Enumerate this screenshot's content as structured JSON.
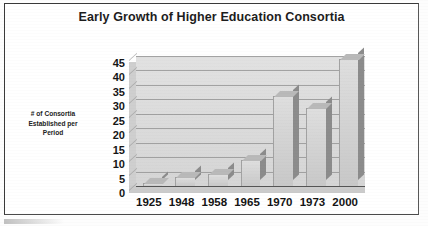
{
  "chart_data": {
    "type": "bar",
    "title": "Early Growth of Higher Education Consortia",
    "xlabel": "",
    "ylabel": "# of Consortia Established per Period",
    "ylabel_lines": [
      "# of Consortia",
      "Established per",
      "Period"
    ],
    "categories": [
      "1925",
      "1948",
      "1958",
      "1965",
      "1970",
      "1973",
      "2000"
    ],
    "values": [
      1,
      3,
      4,
      9,
      31,
      27,
      44
    ],
    "ylim": [
      0,
      45
    ],
    "ytick_step": 5,
    "yticks": [
      "45",
      "40",
      "35",
      "30",
      "25",
      "20",
      "15",
      "10",
      "5",
      "0"
    ],
    "grid": true,
    "legend": false,
    "legend_position": "none",
    "style": "3d-column",
    "series": [
      {
        "name": "# of Consortia Established per Period",
        "values": [
          1,
          3,
          4,
          9,
          31,
          27,
          44
        ]
      }
    ],
    "colors": {
      "bar_front": "#d3d3d3",
      "bar_side": "#8c8c8c",
      "bar_top": "#b9b9b9",
      "plot_background": "#d6d6d6",
      "gridline": "#8e8e8e",
      "text": "#151515",
      "frame": "#3a3a3a"
    }
  }
}
